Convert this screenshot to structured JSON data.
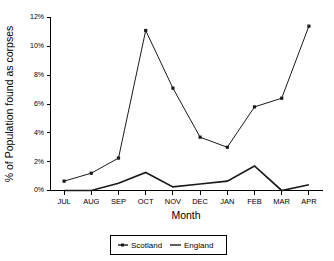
{
  "chart_data": {
    "type": "line",
    "title": "",
    "xlabel": "Month",
    "ylabel": "% of Population found as corpses",
    "categories": [
      "JUL",
      "AUG",
      "SEP",
      "OCT",
      "NOV",
      "DEC",
      "JAN",
      "FEB",
      "MAR",
      "APR"
    ],
    "ylim": [
      0,
      12
    ],
    "ytick_labels": [
      "0%",
      "2%",
      "4%",
      "6%",
      "8%",
      "10%",
      "12%"
    ],
    "ytick_values": [
      0,
      2,
      4,
      6,
      8,
      10,
      12
    ],
    "grid": false,
    "legend_position": "bottom-center",
    "series": [
      {
        "name": "Scotland",
        "marker": "filled-square",
        "values": [
          0.65,
          1.2,
          2.25,
          11.1,
          7.1,
          3.7,
          3.0,
          5.8,
          6.4,
          11.4
        ]
      },
      {
        "name": "England",
        "marker": "none",
        "values": [
          0.0,
          0.0,
          0.5,
          1.25,
          0.25,
          0.45,
          0.65,
          1.7,
          0.0,
          0.4
        ]
      }
    ]
  },
  "legend": {
    "entries": [
      {
        "label": "Scotland",
        "glyph": "marker-line"
      },
      {
        "label": "England",
        "glyph": "line"
      }
    ]
  },
  "colors": {
    "series_stroke": "#1a1a1a",
    "axis": "#000000",
    "background": "#ffffff"
  }
}
